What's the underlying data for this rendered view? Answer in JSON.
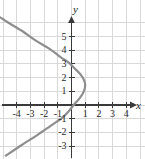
{
  "chart_data": {
    "type": "line",
    "title": "",
    "subtitle": "",
    "xlabel": "x",
    "ylabel": "y",
    "xlim": [
      -5,
      5
    ],
    "ylim": [
      -4,
      6
    ],
    "grid": true,
    "legend": false,
    "legend_position": "none",
    "xticks": [
      -4,
      -3,
      -2,
      -1,
      1,
      2,
      3,
      4
    ],
    "yticks": [
      -3,
      -2,
      -1,
      1,
      2,
      3,
      4,
      5
    ],
    "xtick_labels": [
      "-4",
      "-3",
      "-2",
      "-1",
      "1",
      "2",
      "3",
      "4"
    ],
    "ytick_labels": [
      "-3",
      "-2",
      "-1",
      "1",
      "2",
      "3",
      "4",
      "5"
    ],
    "annotations": [],
    "series": [
      {
        "name": "sideways parabola",
        "orientation": "opens-left",
        "vertex": [
          1.0,
          1.5
        ],
        "x_intercept": [
          1.0,
          0
        ],
        "y_intercept_upper": [
          0,
          3.0
        ],
        "y_intercept_lower": [
          0,
          -1.0
        ],
        "points": [
          [
            -5.2,
            6.4
          ],
          [
            -4.6,
            6.0
          ],
          [
            -3.6,
            5.4
          ],
          [
            -2.6,
            4.7
          ],
          [
            -1.6,
            4.1
          ],
          [
            -0.8,
            3.5
          ],
          [
            -0.2,
            3.1
          ],
          [
            0.2,
            2.7
          ],
          [
            0.6,
            2.3
          ],
          [
            0.85,
            1.95
          ],
          [
            1.0,
            1.5
          ],
          [
            0.9,
            1.0
          ],
          [
            0.6,
            0.5
          ],
          [
            0.2,
            0.05
          ],
          [
            -0.2,
            -0.45
          ],
          [
            -0.7,
            -0.95
          ],
          [
            -1.5,
            -1.5
          ],
          [
            -2.5,
            -2.2
          ],
          [
            -3.6,
            -2.9
          ],
          [
            -4.8,
            -3.7
          ]
        ]
      }
    ]
  },
  "style": {
    "curve_color": "#8e8e8e",
    "axis_color": "#3a3a3a",
    "grid_color": "#d9d9d9",
    "background": "#ffffff",
    "label_color": "#2b2b2b"
  },
  "axis_labels": {
    "x": "x",
    "y": "y"
  }
}
